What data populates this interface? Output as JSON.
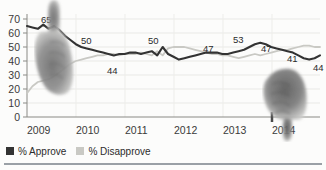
{
  "chart_data": {
    "type": "line",
    "title": "",
    "subtitle": "",
    "xlabel": "",
    "ylabel": "",
    "ylim": [
      0,
      70
    ],
    "grid": true,
    "legend_position": "bottom-left",
    "y_ticks": [
      "70",
      "60",
      "50",
      "40",
      "30",
      "20",
      "10",
      "0"
    ],
    "x_ticks": [
      "2009",
      "2010",
      "2011",
      "2012",
      "2013",
      "2014"
    ],
    "categories": [
      "2009.0",
      "2009.1",
      "2009.2",
      "2009.3",
      "2009.4",
      "2009.5",
      "2009.6",
      "2009.7",
      "2009.8",
      "2009.9",
      "2010.0",
      "2010.1",
      "2010.2",
      "2010.3",
      "2010.4",
      "2010.5",
      "2010.6",
      "2010.7",
      "2010.8",
      "2010.9",
      "2011.0",
      "2011.1",
      "2011.2",
      "2011.3",
      "2011.4",
      "2011.5",
      "2011.6",
      "2011.7",
      "2011.8",
      "2011.9",
      "2012.0",
      "2012.1",
      "2012.2",
      "2012.3",
      "2012.4",
      "2012.5",
      "2012.6",
      "2012.7",
      "2012.8",
      "2012.9",
      "2013.0",
      "2013.1",
      "2013.2",
      "2013.3",
      "2013.4",
      "2013.5",
      "2013.6",
      "2013.7",
      "2013.8",
      "2013.9",
      "2014.0",
      "2014.1",
      "2014.2",
      "2014.3",
      "2014.4"
    ],
    "series": [
      {
        "name": "% Approve",
        "color": "#333333",
        "values": [
          65,
          64,
          63,
          66,
          63,
          65,
          62,
          58,
          55,
          52,
          50,
          49,
          48,
          47,
          46,
          45,
          44,
          45,
          45,
          46,
          46,
          45,
          46,
          47,
          44,
          50,
          45,
          43,
          41,
          42,
          43,
          44,
          45,
          46,
          46,
          46,
          45,
          45,
          46,
          47,
          48,
          50,
          52,
          53,
          52,
          50,
          49,
          48,
          47,
          46,
          44,
          42,
          41,
          42,
          44
        ]
      },
      {
        "name": "% Disapprove",
        "color": "#c9c9c4",
        "values": [
          17,
          22,
          25,
          26,
          27,
          29,
          32,
          35,
          38,
          40,
          41,
          42,
          43,
          44,
          44,
          45,
          45,
          44,
          45,
          45,
          45,
          46,
          45,
          44,
          47,
          44,
          49,
          50,
          50,
          50,
          49,
          48,
          47,
          46,
          45,
          45,
          44,
          44,
          43,
          42,
          43,
          44,
          45,
          44,
          45,
          46,
          47,
          48,
          48,
          49,
          50,
          51,
          51,
          50,
          50
        ]
      }
    ],
    "annotations": [
      {
        "text": "65",
        "series": "% Approve",
        "x": "2009.3",
        "value": 65
      },
      {
        "text": "50",
        "series": "% Approve",
        "x": "2010.0",
        "value": 50
      },
      {
        "text": "44",
        "series": "% Approve",
        "x": "2010.6",
        "value": 44
      },
      {
        "text": "50",
        "series": "% Approve",
        "x": "2011.5",
        "value": 50
      },
      {
        "text": "47",
        "series": "% Approve",
        "x": "2012.6",
        "value": 47
      },
      {
        "text": "53",
        "series": "% Approve",
        "x": "2013.3",
        "value": 53
      },
      {
        "text": "47",
        "series": "% Approve",
        "x": "2013.7",
        "value": 47
      },
      {
        "text": "41",
        "series": "% Approve",
        "x": "2014.2",
        "value": 41
      },
      {
        "text": "44",
        "series": "% Approve",
        "x": "2014.4",
        "value": 44
      }
    ]
  },
  "legend": {
    "approve": {
      "label": "% Approve",
      "color": "#333333"
    },
    "disapprove": {
      "label": "% Disapprove",
      "color": "#c9c9c4"
    }
  },
  "y_axis": {
    "t0": "70",
    "t1": "60",
    "t2": "50",
    "t3": "40",
    "t4": "30",
    "t5": "20",
    "t6": "10",
    "t7": "0"
  },
  "x_axis": {
    "t0": "2009",
    "t1": "2010",
    "t2": "2011",
    "t3": "2012",
    "t4": "2013",
    "t5": "2014"
  },
  "labels": {
    "l65": "65",
    "l50a": "50",
    "l44a": "44",
    "l50b": "50",
    "l47a": "47",
    "l53": "53",
    "l47b": "47",
    "l41": "41",
    "l44b": "44"
  },
  "graphics": {
    "thumbs_up": "thumbs-up-icon",
    "thumbs_down": "thumbs-down-icon"
  }
}
